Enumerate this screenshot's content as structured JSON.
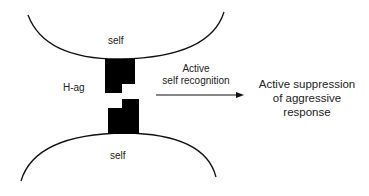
{
  "diagram": {
    "top_cell_label": "self",
    "bottom_cell_label": "self",
    "antigen_label": "H-ag",
    "arrow_label_line1": "Active",
    "arrow_label_line2": "self recognition",
    "result_line1": "Active suppression",
    "result_line2": "of aggressive",
    "result_line3": "response"
  }
}
